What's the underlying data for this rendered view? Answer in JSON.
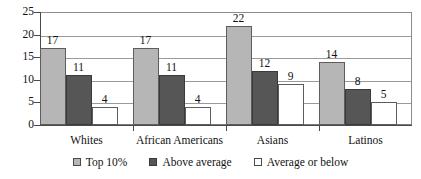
{
  "chart_data": {
    "type": "bar",
    "title": "",
    "subtitle": "",
    "xlabel": "",
    "ylabel": "",
    "ylim": [
      0,
      25
    ],
    "ytick_labels": [
      "0",
      "5",
      "10",
      "15",
      "20",
      "25"
    ],
    "yticks": [
      0,
      5,
      10,
      15,
      20,
      25
    ],
    "grid": "horizontal",
    "legend_position": "bottom",
    "categories": [
      "Whites",
      "African Americans",
      "Asians",
      "Latinos"
    ],
    "series": [
      {
        "name": "Top 10%",
        "color": "#b6b6b6",
        "values": [
          17,
          17,
          22,
          14
        ]
      },
      {
        "name": "Above average",
        "color": "#565656",
        "values": [
          11,
          11,
          12,
          8
        ]
      },
      {
        "name": "Average or below",
        "color": "#ffffff",
        "values": [
          4,
          4,
          9,
          5
        ]
      }
    ],
    "data_labels": [
      [
        "17",
        "11",
        "4"
      ],
      [
        "17",
        "11",
        "4"
      ],
      [
        "22",
        "12",
        "9"
      ],
      [
        "14",
        "8",
        "5"
      ]
    ]
  },
  "legend": {
    "items": [
      {
        "label": "Top 10%"
      },
      {
        "label": "Above average"
      },
      {
        "label": "Average or below"
      }
    ]
  }
}
